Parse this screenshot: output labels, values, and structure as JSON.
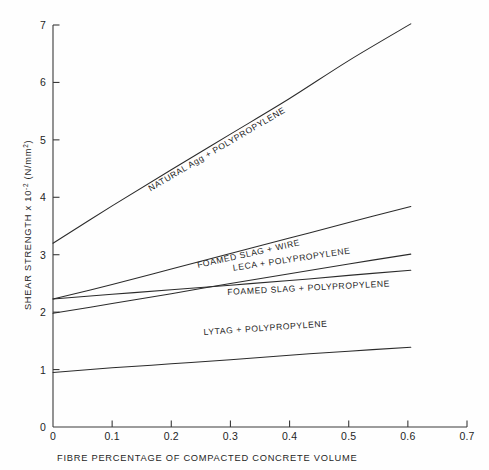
{
  "figure": {
    "width": 489,
    "height": 470,
    "background_color": "#fefefe",
    "line_color": "#2b2b2b",
    "axis_color": "#3a3a3a"
  },
  "axes": {
    "x_title": "FIBRE PERCENTAGE OF COMPACTED CONCRETE VOLUME",
    "y_title_main": "SHEAR STRENGTH x 10",
    "y_title_exponent": "-2",
    "y_title_units_open": " (N/mm",
    "y_title_units_exponent": "2",
    "y_title_units_close": ")",
    "y_title_full": "SHEAR STRENGTH x 10-2 (N/mm2)",
    "x_tick_labels": [
      "0",
      "0.1",
      "0.2",
      "0.3",
      "0.4",
      "0.5",
      "0.6",
      "0.7"
    ],
    "x_tick_values": [
      0,
      0.1,
      0.2,
      0.3,
      0.4,
      0.5,
      0.6,
      0.7
    ],
    "y_tick_labels": [
      "0",
      "1",
      "2",
      "3",
      "4",
      "5",
      "6",
      "7"
    ],
    "y_tick_values": [
      0,
      1,
      2,
      3,
      4,
      5,
      6,
      7
    ]
  },
  "chart_data": {
    "type": "line",
    "title": "",
    "subtitle": "",
    "xlabel": "FIBRE PERCENTAGE OF COMPACTED CONCRETE VOLUME",
    "ylabel": "SHEAR STRENGTH x 10-2 (N/mm2)",
    "xlim": [
      0,
      0.7
    ],
    "ylim": [
      0,
      7
    ],
    "xticks": [
      0,
      0.1,
      0.2,
      0.3,
      0.4,
      0.5,
      0.6,
      0.7
    ],
    "yticks": [
      0,
      1,
      2,
      3,
      4,
      5,
      6,
      7
    ],
    "grid": false,
    "legend": "inline-curve-labels",
    "series": [
      {
        "name": "NATURAL Agg + POLYPROPYLENE",
        "label": "NATURAL Agg + POLYPROPYLENE",
        "x": [
          0.0,
          0.1,
          0.2,
          0.3,
          0.4,
          0.5,
          0.605
        ],
        "values": [
          3.2,
          3.85,
          4.48,
          5.1,
          5.72,
          6.38,
          7.02
        ],
        "label_angle_deg": -30.5,
        "label_anchor_x": 0.165,
        "label_anchor_y": 4.1
      },
      {
        "name": "FOAMED SLAG + WIRE",
        "label": "FOAMED SLAG + WIRE",
        "x": [
          0.0,
          0.1,
          0.2,
          0.3,
          0.4,
          0.5,
          0.605
        ],
        "values": [
          2.23,
          2.48,
          2.75,
          3.02,
          3.29,
          3.56,
          3.84
        ],
        "label_angle_deg": -12.5,
        "label_anchor_x": 0.245,
        "label_anchor_y": 2.77
      },
      {
        "name": "LECA + POLYPROPYLENE",
        "label": "LECA + POLYPROPYLENE",
        "x": [
          0.0,
          0.1,
          0.2,
          0.3,
          0.4,
          0.5,
          0.605
        ],
        "values": [
          1.98,
          2.15,
          2.32,
          2.5,
          2.67,
          2.84,
          3.01
        ],
        "label_angle_deg": -8.5,
        "label_anchor_x": 0.305,
        "label_anchor_y": 2.72
      },
      {
        "name": "FOAMED SLAG + POLYPROPYLENE",
        "label": "FOAMED SLAG + POLYPROPYLENE",
        "x": [
          0.0,
          0.1,
          0.2,
          0.3,
          0.4,
          0.5,
          0.605
        ],
        "values": [
          2.23,
          2.31,
          2.39,
          2.47,
          2.55,
          2.64,
          2.73
        ],
        "label_angle_deg": -3.0,
        "label_anchor_x": 0.295,
        "label_anchor_y": 2.3
      },
      {
        "name": "LYTAG + POLYPROPYLENE",
        "label": "LYTAG + POLYPROPYLENE",
        "x": [
          0.0,
          0.1,
          0.2,
          0.3,
          0.4,
          0.5,
          0.605
        ],
        "values": [
          0.95,
          1.03,
          1.1,
          1.17,
          1.25,
          1.32,
          1.39
        ],
        "label_angle_deg": -4.0,
        "label_anchor_x": 0.255,
        "label_anchor_y": 1.6
      }
    ]
  }
}
